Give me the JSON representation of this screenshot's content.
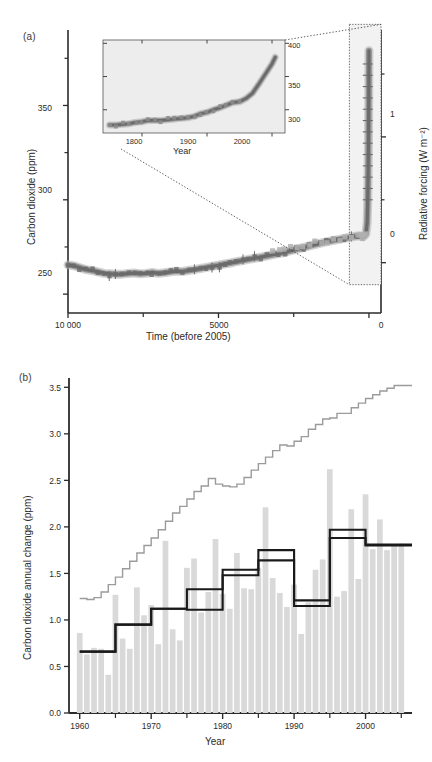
{
  "figure": {
    "panel_a": {
      "tag": "(a)",
      "ylabel_left": "Carbon dioxide (ppm)",
      "ylabel_right": "Radiative forcing (W m⁻²)",
      "xlabel": "Time (before 2005)",
      "y_left_ticks": [
        250,
        300,
        350
      ],
      "y_left_minor_ticks": [
        275,
        325,
        375
      ],
      "y_left_range": [
        240,
        390
      ],
      "y_right_ticks": [
        0,
        1
      ],
      "y_right_minor_ticks": [
        0.5,
        1.5
      ],
      "y_right_range": [
        -0.4,
        1.85
      ],
      "x_ticks": [
        10000,
        5000,
        0
      ],
      "x_tick_labels": [
        "10 000",
        "5000",
        "0"
      ],
      "x_minor_ticks": [
        7500,
        2500
      ],
      "x_range": [
        10000,
        -400
      ],
      "inset": {
        "xlabel": "Year",
        "x_ticks": [
          1800,
          1900,
          2000
        ],
        "x_range": [
          1740,
          2020
        ],
        "y_ticks": [
          300,
          350,
          400
        ],
        "y_range": [
          265,
          405
        ],
        "background": "#ededed"
      },
      "zoom_box": {
        "x_start": -400,
        "x_end": 650,
        "y_start": 255,
        "y_end": 393
      }
    },
    "panel_b": {
      "tag": "(b)",
      "ylabel": "Carbon dioxide annual change (ppm)",
      "xlabel": "Year",
      "y_ticks": [
        0.0,
        0.5,
        1.0,
        1.5,
        2.0,
        2.5,
        3.0,
        3.5
      ],
      "y_tick_labels": [
        "0.0",
        "0.5",
        "1.0",
        "1.5",
        "2.0",
        "2.5",
        "3.0",
        "3.5"
      ],
      "y_range": [
        0,
        3.6
      ],
      "x_ticks": [
        1960,
        1970,
        1980,
        1990,
        2000
      ],
      "x_minor_ticks": [
        1965,
        1975,
        1985,
        1995,
        2005
      ],
      "x_range": [
        1958.5,
        2006.5
      ]
    }
  },
  "colors": {
    "axis": "#2b2b2b",
    "bar": "#d9d9d9",
    "gray_line": "#9b9b9b",
    "black_line": "#1a1a1a",
    "co2_dark": "#6b6b6b",
    "co2_mid": "#8c8c8c",
    "co2_light": "#b0b0b0",
    "inset_bg": "#ededed"
  },
  "chart_data": [
    {
      "type": "line",
      "id": "panel-a-co2-ice-core",
      "title": "",
      "xlabel": "Time (before 2005)",
      "ylabel": "Carbon dioxide (ppm)",
      "ylabel_secondary": "Radiative forcing (W m⁻²)",
      "xlim": [
        10000,
        -400
      ],
      "ylim": [
        240,
        390
      ],
      "ylim_secondary": [
        -0.4,
        1.85
      ],
      "grid": false,
      "legend": "none",
      "x": [
        10000,
        9800,
        9600,
        9400,
        9200,
        9000,
        8800,
        8600,
        8400,
        8200,
        8000,
        7800,
        7600,
        7400,
        7200,
        7000,
        6800,
        6600,
        6400,
        6200,
        6000,
        5800,
        5600,
        5400,
        5200,
        5000,
        4800,
        4600,
        4400,
        4200,
        4000,
        3800,
        3600,
        3400,
        3200,
        3000,
        2800,
        2600,
        2400,
        2200,
        2000,
        1800,
        1600,
        1400,
        1200,
        1000,
        800,
        600,
        400,
        300,
        250,
        200,
        150,
        100,
        60,
        45,
        30,
        20,
        10,
        5,
        0
      ],
      "values": [
        265.5,
        265.0,
        264.0,
        263.0,
        262.5,
        261.8,
        261.0,
        260.8,
        260.5,
        260.6,
        260.9,
        261.2,
        260.8,
        261.0,
        261.5,
        261.0,
        261.3,
        261.8,
        262.2,
        262.0,
        262.5,
        263.0,
        263.6,
        264.2,
        264.8,
        265.3,
        266.0,
        266.5,
        267.2,
        267.8,
        268.4,
        269.0,
        269.6,
        270.2,
        270.9,
        271.5,
        272.2,
        273.0,
        273.8,
        274.6,
        275.4,
        276.2,
        277.0,
        277.8,
        278.4,
        279.0,
        279.6,
        280.2,
        280.8,
        281.0,
        280.6,
        280.4,
        281.0,
        282.0,
        288.0,
        297.0,
        311.0,
        325.0,
        345.0,
        360.0,
        379.0
      ],
      "annotation": "Ice-core and modern CO2 record; vertical rise at right corresponds to industrial era"
    },
    {
      "type": "line",
      "id": "panel-a-inset-co2-since-1750",
      "title": "",
      "xlabel": "Year",
      "ylabel": "",
      "xlim": [
        1740,
        2020
      ],
      "ylim": [
        265,
        405
      ],
      "grid": false,
      "legend": "none",
      "x": [
        1750,
        1760,
        1770,
        1780,
        1790,
        1800,
        1810,
        1820,
        1830,
        1840,
        1850,
        1860,
        1870,
        1880,
        1890,
        1900,
        1910,
        1920,
        1930,
        1940,
        1950,
        1960,
        1970,
        1980,
        1990,
        2000,
        2005
      ],
      "values": [
        277,
        277,
        278,
        279,
        281,
        282,
        284,
        284,
        284,
        285,
        286,
        287,
        288,
        290,
        294,
        296,
        300,
        303,
        307,
        311,
        312,
        317,
        325,
        339,
        354,
        369,
        379
      ]
    },
    {
      "type": "bar",
      "id": "panel-b-annual-change",
      "title": "",
      "xlabel": "Year",
      "ylabel": "Carbon dioxide annual change (ppm)",
      "xlim": [
        1958.5,
        2006.5
      ],
      "ylim": [
        0,
        3.6
      ],
      "grid": false,
      "legend": "none",
      "categories": [
        1960,
        1961,
        1962,
        1963,
        1964,
        1965,
        1966,
        1967,
        1968,
        1969,
        1970,
        1971,
        1972,
        1973,
        1974,
        1975,
        1976,
        1977,
        1978,
        1979,
        1980,
        1981,
        1982,
        1983,
        1984,
        1985,
        1986,
        1987,
        1988,
        1989,
        1990,
        1991,
        1992,
        1993,
        1994,
        1995,
        1996,
        1997,
        1998,
        1999,
        2000,
        2001,
        2002,
        2003,
        2004,
        2005
      ],
      "values": [
        0.86,
        0.63,
        0.7,
        0.69,
        0.41,
        1.27,
        0.8,
        0.69,
        1.35,
        1.05,
        1.16,
        0.74,
        1.85,
        0.9,
        0.78,
        1.56,
        1.66,
        1.08,
        1.3,
        1.87,
        1.28,
        1.12,
        1.72,
        1.34,
        1.33,
        1.56,
        2.21,
        1.45,
        1.29,
        1.14,
        1.38,
        0.85,
        1.19,
        1.54,
        1.65,
        2.62,
        1.25,
        1.31,
        2.19,
        1.44,
        2.35,
        1.76,
        2.08,
        1.75,
        1.8,
        1.82
      ],
      "series": [
        {
          "name": "decadal-mean-step-black-upper",
          "type": "step",
          "x": [
            1960,
            1965,
            1970,
            1975,
            1980,
            1985,
            1990,
            1995,
            2000,
            2005
          ],
          "values": [
            0.66,
            0.95,
            1.12,
            1.33,
            1.48,
            1.75,
            1.15,
            1.97,
            1.8,
            1.8
          ]
        },
        {
          "name": "decadal-mean-step-black-lower",
          "type": "step",
          "x": [
            1960,
            1965,
            1970,
            1975,
            1980,
            1985,
            1990,
            1995,
            2000,
            2005
          ],
          "values": [
            0.66,
            0.95,
            1.12,
            1.11,
            1.54,
            1.64,
            1.21,
            1.88,
            1.81,
            1.81
          ]
        },
        {
          "name": "smoothed-gray-staircase",
          "type": "step",
          "x": [
            1960,
            1961,
            1962,
            1963,
            1964,
            1965,
            1966,
            1967,
            1968,
            1969,
            1970,
            1971,
            1972,
            1973,
            1974,
            1975,
            1976,
            1977,
            1978,
            1979,
            1980,
            1981,
            1982,
            1983,
            1984,
            1985,
            1986,
            1987,
            1988,
            1989,
            1990,
            1991,
            1992,
            1993,
            1994,
            1995,
            1996,
            1997,
            1998,
            1999,
            2000,
            2001,
            2002,
            2003,
            2004,
            2005
          ],
          "values": [
            1.23,
            1.22,
            1.24,
            1.3,
            1.38,
            1.46,
            1.55,
            1.63,
            1.72,
            1.8,
            1.88,
            1.97,
            2.06,
            2.15,
            2.22,
            2.3,
            2.38,
            2.44,
            2.52,
            2.46,
            2.44,
            2.43,
            2.46,
            2.53,
            2.61,
            2.68,
            2.75,
            2.82,
            2.88,
            2.87,
            2.92,
            2.97,
            3.05,
            3.1,
            3.16,
            3.17,
            3.22,
            3.22,
            3.28,
            3.33,
            3.38,
            3.42,
            3.46,
            3.49,
            3.52,
            3.52
          ]
        }
      ]
    }
  ]
}
